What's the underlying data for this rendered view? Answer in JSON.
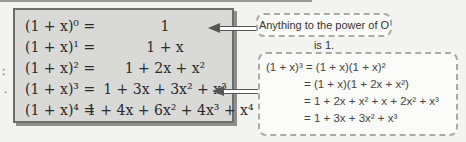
{
  "equations_box": {
    "rows": [
      {
        "lhs": "(1 + x)⁰ =",
        "rhs": "1"
      },
      {
        "lhs": "(1 + x)¹ =",
        "rhs": "1 + x"
      },
      {
        "lhs": "(1 + x)² =",
        "rhs": "1 + 2x + x²"
      },
      {
        "lhs": "(1 + x)³ =",
        "rhs": "1 + 3x + 3x² + x³"
      },
      {
        "lhs": "(1 + x)⁴ =",
        "rhs": "1 + 4x + 6x² + 4x³ + x⁴"
      }
    ]
  },
  "annotations": {
    "power_zero_note": "Anything to the power of O is 1.",
    "cube_working": [
      "(1 + x)³ = (1 + x)(1 + x)²",
      "= (1 + x)(1 + 2x + x²)",
      "= 1 + 2x + x² + x + 2x² + x³",
      "= 1 + 3x + 3x² + x³"
    ]
  },
  "edge_marks": [
    ":",
    "."
  ],
  "colors": {
    "box_fill": "#d9d9d7",
    "box_border": "#6e6e6e",
    "page_bg": "#f3f3f1"
  }
}
